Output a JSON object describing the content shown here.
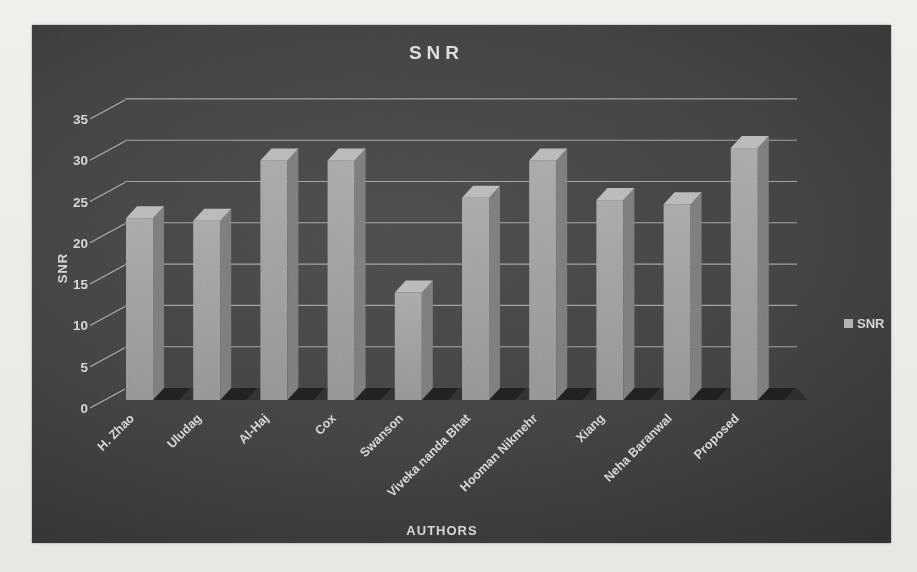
{
  "chart_data": {
    "type": "bar",
    "style": "3d-column-dark",
    "title": "SNR",
    "xlabel": "AUTHORS",
    "ylabel": "SNR",
    "categories": [
      "H. Zhao",
      "Uludag",
      "Al-Haj",
      "Cox",
      "Swanson",
      "Viveka nanda Bhat",
      "Hooman Nikmehr",
      "Xiang",
      "Neha Baranwal",
      "Proposed"
    ],
    "series": [
      {
        "name": "SNR",
        "values": [
          22,
          21.7,
          29,
          29,
          13,
          24.5,
          29,
          24.2,
          23.7,
          30.5
        ]
      }
    ],
    "ylim": [
      0,
      35
    ],
    "yticks": [
      0,
      5,
      10,
      15,
      20,
      25,
      30,
      35
    ],
    "grid": true,
    "legend_position": "right"
  },
  "colors": {
    "page_bg": "#efedea",
    "panel_center": "#4d4d4d",
    "panel_edge": "#1d1d1d",
    "gridline": "#d8d8d8",
    "tick_text": "#d6d6d6",
    "title_text": "#dedede",
    "bar_front": "#a0a0a0",
    "bar_side": "#7c7c7c",
    "bar_top": "#b9b9b9",
    "floor_shadow": "#141414",
    "legend_marker": "#b2b2b2"
  }
}
